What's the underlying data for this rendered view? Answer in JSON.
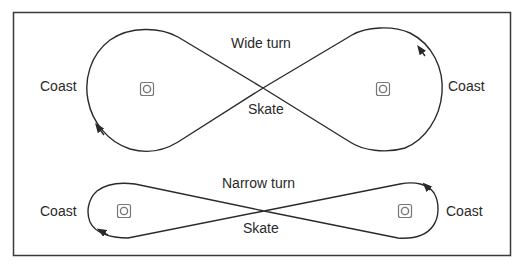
{
  "figure": {
    "wide": {
      "title": "Wide turn",
      "left_label": "Coast",
      "right_label": "Coast",
      "center_label": "Skate"
    },
    "narrow": {
      "title": "Narrow turn",
      "left_label": "Coast",
      "right_label": "Coast",
      "center_label": "Skate"
    }
  },
  "colors": {
    "stroke": "#2a2a2a",
    "frame": "#3a3a3a",
    "marker": "#777777",
    "background": "#ffffff"
  }
}
